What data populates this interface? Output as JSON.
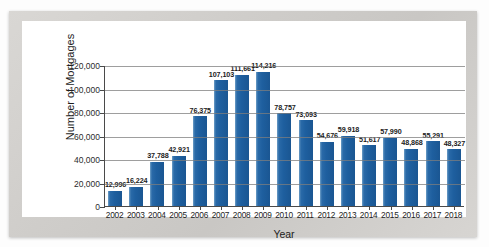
{
  "title_strip": "",
  "chart_data": {
    "type": "bar",
    "title": "",
    "xlabel": "Year",
    "ylabel": "Number of Mortgages",
    "ylim": [
      0,
      120000
    ],
    "ytick_labels": [
      "120,000",
      "100,000",
      "80,000",
      "60,000",
      "40,000",
      "20,000",
      "0"
    ],
    "ytick_values": [
      120000,
      100000,
      80000,
      60000,
      40000,
      20000,
      0
    ],
    "grid": true,
    "legend": "none",
    "bar_color": "#1e5f9f",
    "categories": [
      "2002",
      "2003",
      "2004",
      "2005",
      "2006",
      "2007",
      "2008",
      "2009",
      "2010",
      "2011",
      "2012",
      "2013",
      "2014",
      "2015",
      "2016",
      "2017",
      "2018"
    ],
    "values": [
      12996,
      16224,
      37788,
      42921,
      76375,
      107103,
      111661,
      114216,
      78757,
      73093,
      54676,
      59918,
      51617,
      57990,
      48868,
      55291,
      48327
    ],
    "data_labels": [
      "12,996",
      "16,224",
      "37,788",
      "42,921",
      "76,375",
      "107,103",
      "111,661",
      "114,216",
      "78,757",
      "73,093",
      "54,676",
      "59,918",
      "51,617",
      "57,990",
      "48,868",
      "55,291",
      "48,327"
    ]
  }
}
